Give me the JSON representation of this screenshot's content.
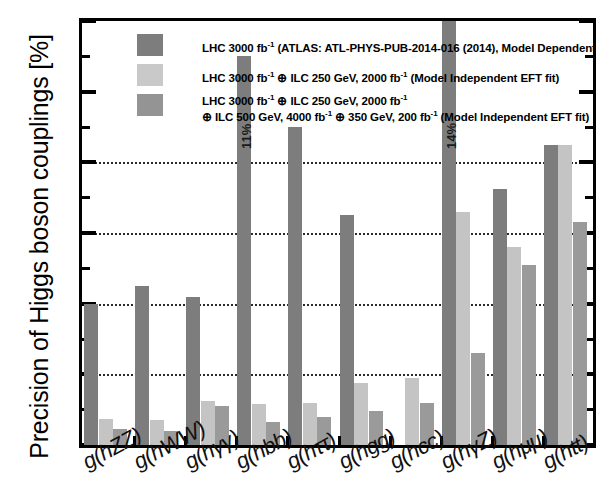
{
  "chart_data": {
    "type": "bar",
    "title": "",
    "xlabel": "",
    "ylabel": "Precision of Higgs boson couplings [%]",
    "ylim": [
      0,
      12
    ],
    "ytick_labels": [
      "0",
      "2",
      "4",
      "6",
      "8",
      "10",
      "12"
    ],
    "ytick_values": [
      0,
      2,
      4,
      6,
      8,
      10,
      12
    ],
    "yminor_values": [
      1,
      3,
      5,
      7,
      9,
      11
    ],
    "gridlines": [
      2,
      4,
      6,
      8
    ],
    "grid": true,
    "legend_position": "top-left inside",
    "categories": [
      "g(hZZ)",
      "g(hWW)",
      "g(hγγ)",
      "g(hbb)",
      "g(hττ)",
      "g(hgg)",
      "g(hcc)",
      "g(hγZ)",
      "g(hμμ)",
      "g(htt)"
    ],
    "series": [
      {
        "name": "LHC 3000 fb-1 (ATLAS: ATL-PHYS-PUB-2014-016 (2014), Model Dependent kappa fit)",
        "color": "#7d7d7d",
        "values": [
          4.0,
          4.5,
          4.2,
          11.0,
          9.0,
          6.5,
          null,
          14.0,
          7.25,
          8.5
        ]
      },
      {
        "name": "LHC 3000 fb-1 + ILC 250 GeV, 2000 fb-1 (Model Independent EFT fit)",
        "color": "#c4c4c4",
        "values": [
          0.75,
          0.7,
          1.25,
          1.15,
          1.2,
          1.75,
          1.9,
          6.6,
          5.6,
          8.5
        ]
      },
      {
        "name": "LHC 3000 fb-1 + ILC 250 GeV, 2000 fb-1 + ILC 500 GeV, 4000 fb-1 + 350 GeV, 200 fb-1 (Model Independent EFT fit)",
        "color": "#9a9a9a",
        "values": [
          0.45,
          0.4,
          1.1,
          0.65,
          0.8,
          0.95,
          1.2,
          2.6,
          5.1,
          6.3
        ]
      }
    ],
    "annotations": [
      {
        "category": "g(hbb)",
        "series": 0,
        "text": "11%",
        "note": "bar exceeds axis maximum"
      },
      {
        "category": "g(hγZ)",
        "series": 0,
        "text": "14%",
        "note": "bar exceeds axis maximum"
      }
    ]
  },
  "legend": {
    "entries": [
      {
        "prefix": "LHC 3000 fb",
        "sup1": "-1",
        "mid": " (ATLAS: ATL-PHYS-PUB-2014-016 (2014), Model Dependent ",
        "kappa": "κ",
        "suffix": " fit)"
      },
      {
        "line1_a": "LHC 3000 fb",
        "sup1": "-1",
        "line1_b": " ⊕ ILC 250 GeV, 2000 fb",
        "sup2": "-1",
        "line1_c": " (Model Independent EFT fit)"
      },
      {
        "l1_a": "LHC 3000 fb",
        "l1_sup": "-1",
        "l1_b": " ⊕ ILC 250 GeV, 2000 fb",
        "l1_sup2": "-1",
        "l2_a": "⊕ ILC 500 GeV, 4000 fb",
        "l2_sup": "-1",
        "l2_b": " ⊕ 350 GeV, 200 fb",
        "l2_sup2": "-1",
        "l2_c": " (Model Independent EFT fit)"
      }
    ]
  },
  "axis": {
    "y_title": "Precision of Higgs boson couplings [%]"
  }
}
